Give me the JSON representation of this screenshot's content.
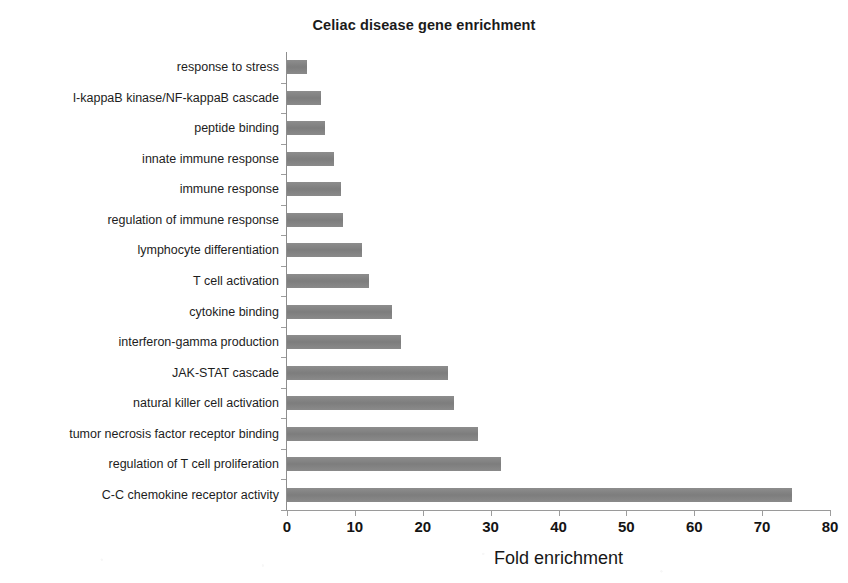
{
  "figure": {
    "width": 848,
    "height": 583,
    "background": "#ffffff",
    "bar_color": "#848484",
    "axis_color": "#9a9a9a",
    "text_color": "#1a1a1a"
  },
  "chart_data": {
    "type": "bar",
    "orientation": "horizontal",
    "title": "Celiac disease gene enrichment",
    "xlabel": "Fold enrichment",
    "ylabel": "",
    "xlim": [
      0,
      80
    ],
    "xticks": [
      0,
      10,
      20,
      30,
      40,
      50,
      60,
      70,
      80
    ],
    "xtick_labels": [
      "0",
      "10",
      "20",
      "30",
      "40",
      "50",
      "60",
      "70",
      "80"
    ],
    "grid": false,
    "legend": false,
    "legend_position": "none",
    "categories": [
      "response to stress",
      "I-kappaB kinase/NF-kappaB cascade",
      "peptide binding",
      "innate immune response",
      "immune response",
      "regulation of immune response",
      "lymphocyte differentiation",
      "T cell activation",
      "cytokine binding",
      "interferon-gamma production",
      "JAK-STAT cascade",
      "natural killer cell activation",
      "tumor necrosis factor receptor binding",
      "regulation of T cell proliferation",
      "C-C chemokine receptor activity"
    ],
    "values": [
      2.9,
      5.0,
      5.6,
      6.9,
      8.0,
      8.3,
      11.1,
      12.1,
      15.5,
      16.8,
      23.7,
      24.6,
      28.2,
      31.6,
      74.4
    ],
    "series": [
      {
        "name": "Fold enrichment",
        "values": [
          2.9,
          5.0,
          5.6,
          6.9,
          8.0,
          8.3,
          11.1,
          12.1,
          15.5,
          16.8,
          23.7,
          24.6,
          28.2,
          31.6,
          74.4
        ]
      }
    ]
  }
}
